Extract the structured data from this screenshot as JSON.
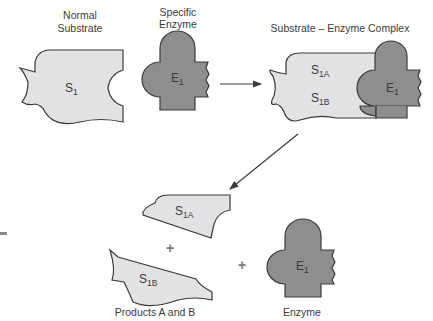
{
  "diagram": {
    "labels": {
      "normal_substrate_line1": "Normal",
      "normal_substrate_line2": "Substrate",
      "specific_enzyme_line1": "Specific",
      "specific_enzyme_line2": "Enzyme",
      "complex_title": "Substrate – Enzyme Complex",
      "products_caption": "Products A and B",
      "enzyme_caption": "Enzyme"
    },
    "symbols": {
      "substrate": {
        "base": "S",
        "sub": "1"
      },
      "enzyme": {
        "base": "E",
        "sub": "1"
      },
      "product_a": {
        "base": "S",
        "sub": "1A"
      },
      "product_b": {
        "base": "S",
        "sub": "1B"
      },
      "plus": "+"
    },
    "colors": {
      "substrate_fill": "#e2e2e4",
      "enzyme_fill": "#8e8e8e",
      "stroke": "#3a3a3a",
      "plus": "#7a7a7a"
    }
  }
}
